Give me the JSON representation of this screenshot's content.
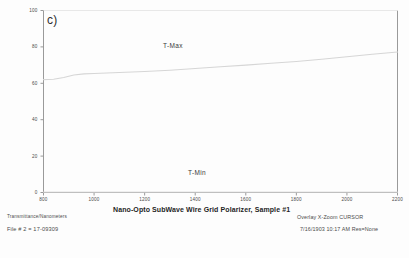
{
  "panel": {
    "letter": "c)"
  },
  "footer": {
    "y_quantity_label": "Transmittance/Nanometers",
    "file_id": "File # 2 = 17-09309",
    "mode": "Overlay X-Zoom CURSOR",
    "timestamp": "7/16/1903  10:17 AM  Res=None"
  },
  "colors": {
    "background": "#fdfdfd",
    "axis": "#9a9a9a",
    "curve": "#d6d6d6",
    "text": "#3a3a3a"
  },
  "chart_data": {
    "type": "line",
    "title": "Nano-Opto SubWave Wire Grid Polarizer, Sample #1",
    "xlabel": "",
    "ylabel": "",
    "xlim": [
      800,
      2200
    ],
    "ylim": [
      0,
      100
    ],
    "xticks": [
      800,
      1000,
      1200,
      1400,
      1600,
      1800,
      2000,
      2200
    ],
    "yticks": [
      0,
      20,
      40,
      60,
      80,
      100
    ],
    "grid": false,
    "legend_position": "inline-annotation",
    "annotations": [
      {
        "text": "T-Max",
        "x": 1330,
        "y": 82
      },
      {
        "text": "T-Min",
        "x": 1430,
        "y": 9
      }
    ],
    "series": [
      {
        "name": "T-Max",
        "x": [
          800,
          840,
          880,
          920,
          960,
          1000,
          1100,
          1200,
          1300,
          1400,
          1500,
          1600,
          1700,
          1800,
          1900,
          2000,
          2100,
          2200
        ],
        "values": [
          62.0,
          62.2,
          63.2,
          64.6,
          65.2,
          65.4,
          65.9,
          66.5,
          67.2,
          68.1,
          69.1,
          70.0,
          71.0,
          72.0,
          73.2,
          74.6,
          76.0,
          77.2
        ]
      },
      {
        "name": "T-Min",
        "x": [
          800,
          1000,
          1200,
          1400,
          1600,
          1800,
          2000,
          2200
        ],
        "values": [
          0.2,
          0.2,
          0.2,
          0.2,
          0.2,
          0.2,
          0.2,
          0.2
        ]
      }
    ]
  }
}
